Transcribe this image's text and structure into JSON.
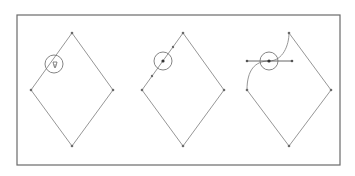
{
  "canvas": {
    "width": 355,
    "height": 176,
    "background": "#ffffff"
  },
  "colors": {
    "frame": "#6a6a6a",
    "path": "#8a8a8a",
    "anchor": "#6a6a6a",
    "anchor_selected": "#333333",
    "cursor_circle": "#777777",
    "handle": "#555555"
  },
  "frame": {
    "x": 17,
    "y": 15,
    "width": 323,
    "height": 150,
    "label": "illustration-frame"
  },
  "panels": [
    {
      "name": "step-1-hover-segment",
      "diamond": {
        "top": [
          72,
          33
        ],
        "right": [
          113,
          90
        ],
        "bottom": [
          72,
          146
        ],
        "left": [
          31,
          90
        ]
      },
      "cursor": {
        "cx": 54,
        "cy": 64,
        "r": 9,
        "glyph": "pen-add-cursor"
      },
      "added_points": []
    },
    {
      "name": "step-2-point-added",
      "diamond": {
        "top": [
          183,
          33
        ],
        "right": [
          224,
          90
        ],
        "bottom": [
          183,
          146
        ],
        "left": [
          142,
          90
        ]
      },
      "cursor": {
        "cx": 163,
        "cy": 61,
        "r": 9,
        "glyph": "circle-cursor"
      },
      "added_points": [
        [
          163,
          61
        ],
        [
          173,
          47
        ],
        [
          152,
          76
        ]
      ]
    },
    {
      "name": "step-3-drag-handles",
      "diamond": {
        "top": [
          289,
          33
        ],
        "right": [
          331,
          90
        ],
        "bottom": [
          289,
          146
        ],
        "left": [
          247,
          90
        ]
      },
      "cursor": {
        "cx": 269,
        "cy": 61,
        "r": 9,
        "glyph": "circle-cursor"
      },
      "anchor": [
        269,
        61
      ],
      "handles": {
        "left": [
          247,
          61
        ],
        "right": [
          292,
          61
        ]
      },
      "curve_path": "M 247 90 C 247 70, 255 61, 269 61 C 283 61, 289 45, 289 33"
    }
  ]
}
